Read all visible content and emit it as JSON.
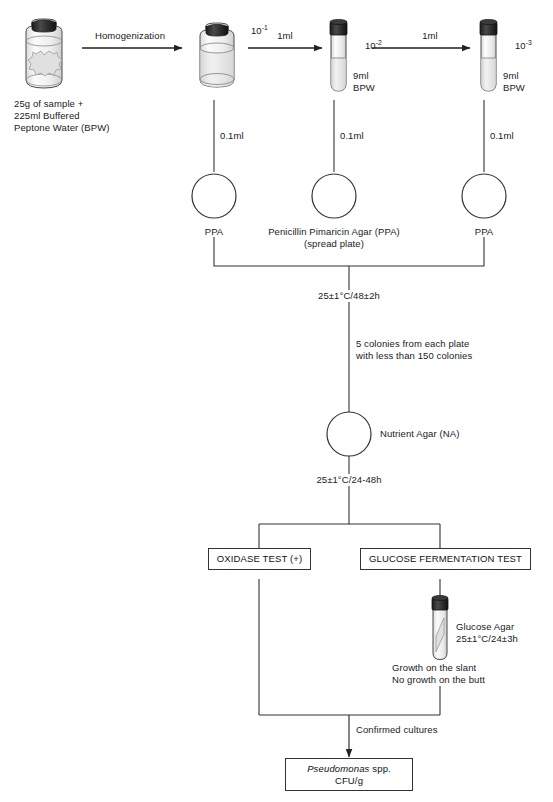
{
  "diagram": {
    "sample_caption": "25g of sample +\n225ml Buffered\nPeptone Water (BPW)",
    "homogenization_label": "Homogenization",
    "transfer_1ml_a": "1ml",
    "transfer_1ml_b": "1ml",
    "dilution_1": "10",
    "dilution_1_exp": "-1",
    "dilution_2": "10",
    "dilution_2_exp": "-2",
    "dilution_3": "10",
    "dilution_3_exp": "-3",
    "tube_2_caption": "9ml\nBPW",
    "tube_3_caption": "9ml\nBPW",
    "plating_volume_1": "0.1ml",
    "plating_volume_2": "0.1ml",
    "plating_volume_3": "0.1ml",
    "plate_left_label": "PPA",
    "plate_center_label": "Penicillin Pimaricin Agar (PPA)\n(spread plate)",
    "plate_right_label": "PPA",
    "incubation_ppa": "25±1°C/48±2h",
    "colony_pick_note": "5 colonies from each plate\nwith less than 150 colonies",
    "nutrient_agar_label": "Nutrient Agar (NA)",
    "incubation_na": "25±1°C/24-48h",
    "oxidase_test_label": "OXIDASE TEST (+)",
    "glucose_test_label": "GLUCOSE FERMENTATION TEST",
    "glucose_agar_caption": "Glucose Agar\n25±1°C/24±3h",
    "glucose_result_note": "Growth on the slant\nNo growth on the butt",
    "confirmed_label": "Confirmed cultures",
    "result_genus": "Pseudomonas",
    "result_suffix": " spp.",
    "result_unit": "CFU/g"
  },
  "colors": {
    "stroke": "#333333",
    "cap_dark": "#2b2b2b",
    "glass_fill": "#f2f2f2",
    "liquid_fill": "#e4e4e4",
    "text": "#1a1a1a",
    "background": "#ffffff"
  }
}
